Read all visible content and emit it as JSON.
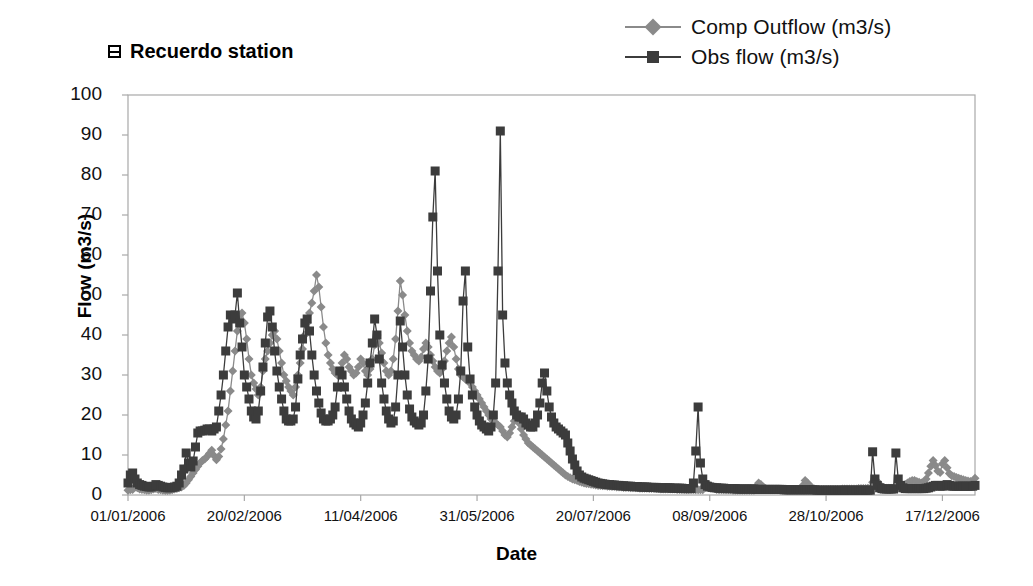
{
  "chart_title": "Recuerdo station",
  "title_icon": "table-grid-icon",
  "axes": {
    "xlabel": "Date",
    "ylabel": "Flow (m3/s)",
    "yticks": [
      "100",
      "90",
      "80",
      "70",
      "60",
      "50",
      "40",
      "30",
      "20",
      "10",
      "0"
    ],
    "ylim": [
      0,
      100
    ],
    "xticks": [
      "01/01/2006",
      "20/02/2006",
      "11/04/2006",
      "31/05/2006",
      "20/07/2006",
      "08/09/2006",
      "28/10/2006",
      "17/12/2006"
    ],
    "xlim_days": [
      0,
      364
    ],
    "xtick_days": [
      0,
      50,
      100,
      150,
      200,
      250,
      300,
      350
    ],
    "grid": false
  },
  "legend": {
    "position": "top-right",
    "entries": [
      {
        "label": "Comp Outflow (m3/s)",
        "marker": "diamond",
        "color": "#8a8a8a"
      },
      {
        "label": "Obs flow (m3/s)",
        "marker": "square",
        "color": "#3c3c3c"
      }
    ]
  },
  "colors": {
    "comp_outflow": "#8a8a8a",
    "obs_flow": "#3c3c3c",
    "axis": "#a8a8a8",
    "text": "#111111",
    "background": "#ffffff"
  },
  "chart_data": {
    "type": "line",
    "title": "Recuerdo station",
    "xlabel": "Date",
    "ylabel": "Flow (m3/s)",
    "ylim": [
      0,
      100
    ],
    "grid": false,
    "legend_position": "top-right",
    "x_start_date": "01/01/2006",
    "x_end_date": "31/12/2006",
    "x_unit": "day-of-year (0-364)",
    "series": [
      {
        "name": "Comp Outflow (m3/s)",
        "marker": "diamond",
        "color": "#8a8a8a",
        "values": [
          1.2,
          1.3,
          1.4,
          2.0,
          1.8,
          1.5,
          1.4,
          1.3,
          1.2,
          1.2,
          1.3,
          1.5,
          1.6,
          1.4,
          1.3,
          1.2,
          1.1,
          1.1,
          1.2,
          1.3,
          1.5,
          1.6,
          1.8,
          2.0,
          2.4,
          3.0,
          3.8,
          4.6,
          5.5,
          6.4,
          7.2,
          8.0,
          8.6,
          9.0,
          9.6,
          10.4,
          11.2,
          9.8,
          8.8,
          9.6,
          11.5,
          14.0,
          17.5,
          21.0,
          26.0,
          31.0,
          36.0,
          41.0,
          44.0,
          45.5,
          43.0,
          39.0,
          34.0,
          30.0,
          28.0,
          26.5,
          25.0,
          27.0,
          31.0,
          34.0,
          36.0,
          38.0,
          40.0,
          41.0,
          39.0,
          36.0,
          33.0,
          30.0,
          28.5,
          27.0,
          26.0,
          25.0,
          27.0,
          30.0,
          33.0,
          36.5,
          40.0,
          43.0,
          45.5,
          48.0,
          51.0,
          55.0,
          52.0,
          47.0,
          42.0,
          38.0,
          35.0,
          33.0,
          31.5,
          30.5,
          30.0,
          31.0,
          33.0,
          35.0,
          34.0,
          32.0,
          31.0,
          30.0,
          30.5,
          32.0,
          34.0,
          33.0,
          31.0,
          30.0,
          31.5,
          34.0,
          37.5,
          40.0,
          38.0,
          35.5,
          33.0,
          31.0,
          30.0,
          31.0,
          34.0,
          39.0,
          46.0,
          53.5,
          50.0,
          45.0,
          41.0,
          38.0,
          36.0,
          35.0,
          34.0,
          33.5,
          34.5,
          36.5,
          38.0,
          37.0,
          35.0,
          33.5,
          32.0,
          31.0,
          30.5,
          31.5,
          33.5,
          36.0,
          38.0,
          39.5,
          37.0,
          34.0,
          31.5,
          30.0,
          29.5,
          29.0,
          28.5,
          28.0,
          27.0,
          26.0,
          25.0,
          24.0,
          23.0,
          22.0,
          21.0,
          20.0,
          19.0,
          18.5,
          18.0,
          17.5,
          17.0,
          16.0,
          15.0,
          14.5,
          15.5,
          17.0,
          18.5,
          19.5,
          18.0,
          16.5,
          15.0,
          14.0,
          13.0,
          12.5,
          12.0,
          11.5,
          11.0,
          10.5,
          10.0,
          9.5,
          9.0,
          8.5,
          8.0,
          7.5,
          7.0,
          6.5,
          6.0,
          5.5,
          5.0,
          4.6,
          4.3,
          4.0,
          3.8,
          3.6,
          3.4,
          3.2,
          3.0,
          2.9,
          2.8,
          2.7,
          2.6,
          2.5,
          2.4,
          2.4,
          2.3,
          2.3,
          2.2,
          2.2,
          2.1,
          2.1,
          2.0,
          2.0,
          2.0,
          1.9,
          1.9,
          1.9,
          1.8,
          1.8,
          1.8,
          1.8,
          1.7,
          1.7,
          1.7,
          1.7,
          1.6,
          1.6,
          1.6,
          1.6,
          1.6,
          1.5,
          1.5,
          1.5,
          1.5,
          1.5,
          1.5,
          1.5,
          1.4,
          1.4,
          1.4,
          1.4,
          1.4,
          1.4,
          1.4,
          1.4,
          1.3,
          1.3,
          1.3,
          1.3,
          2.0,
          2.6,
          2.4,
          2.0,
          1.6,
          1.4,
          1.3,
          1.3,
          1.3,
          1.3,
          1.3,
          1.3,
          1.2,
          1.2,
          1.2,
          1.2,
          1.2,
          1.2,
          1.2,
          1.2,
          1.2,
          1.2,
          2.2,
          3.0,
          2.6,
          2.0,
          1.6,
          1.4,
          1.3,
          1.3,
          1.3,
          1.3,
          1.3,
          1.3,
          1.3,
          1.3,
          1.3,
          1.3,
          1.3,
          1.3,
          1.3,
          1.3,
          2.4,
          3.6,
          3.0,
          2.4,
          1.8,
          1.5,
          1.4,
          1.4,
          1.4,
          1.4,
          1.4,
          1.4,
          1.4,
          1.4,
          1.4,
          1.4,
          1.4,
          1.5,
          1.5,
          1.5,
          1.5,
          1.5,
          1.5,
          1.5,
          1.6,
          1.6,
          1.6,
          1.6,
          1.7,
          1.7,
          3.2,
          4.0,
          3.4,
          2.6,
          2.0,
          1.8,
          1.7,
          1.7,
          1.7,
          1.8,
          1.8,
          1.9,
          2.0,
          2.2,
          2.6,
          3.0,
          3.4,
          3.6,
          3.6,
          3.4,
          3.2,
          3.0,
          3.2,
          4.0,
          5.5,
          7.2,
          8.6,
          7.4,
          6.0,
          5.6,
          7.8,
          8.6,
          6.8,
          5.4,
          4.8,
          4.6,
          4.4,
          4.2,
          4.0,
          3.8,
          3.6,
          3.5,
          3.4,
          3.4,
          4.2
        ]
      },
      {
        "name": "Obs flow (m3/s)",
        "marker": "square",
        "color": "#3c3c3c",
        "values": [
          3.0,
          5.0,
          5.5,
          4.0,
          3.0,
          2.6,
          2.4,
          2.2,
          2.1,
          2.0,
          2.0,
          2.2,
          2.6,
          2.4,
          2.2,
          2.0,
          1.9,
          1.8,
          1.8,
          1.9,
          2.0,
          2.2,
          3.0,
          5.0,
          6.5,
          10.5,
          8.0,
          7.0,
          8.5,
          12.0,
          15.5,
          16.0,
          16.0,
          16.2,
          16.5,
          16.5,
          16.0,
          16.5,
          17.0,
          21.0,
          25.0,
          30.0,
          36.0,
          42.0,
          45.0,
          44.0,
          45.0,
          50.5,
          43.0,
          37.0,
          30.0,
          27.0,
          24.0,
          21.0,
          19.5,
          19.0,
          21.0,
          26.0,
          32.0,
          38.0,
          44.5,
          46.0,
          42.0,
          36.0,
          31.0,
          27.0,
          24.0,
          21.0,
          19.0,
          18.5,
          18.5,
          19.0,
          22.0,
          29.0,
          35.0,
          39.0,
          43.0,
          44.0,
          41.0,
          35.0,
          30.0,
          26.0,
          23.0,
          20.5,
          19.0,
          18.5,
          18.5,
          19.0,
          20.0,
          22.0,
          27.0,
          31.0,
          30.0,
          27.0,
          24.0,
          21.0,
          19.0,
          18.0,
          17.5,
          17.0,
          18.0,
          20.0,
          23.0,
          28.0,
          33.0,
          38.0,
          44.0,
          40.0,
          34.0,
          28.0,
          24.0,
          21.0,
          19.0,
          18.0,
          18.5,
          22.0,
          30.0,
          43.5,
          37.0,
          30.0,
          25.0,
          21.5,
          19.5,
          18.5,
          18.0,
          17.5,
          18.0,
          20.0,
          26.0,
          34.0,
          51.0,
          69.5,
          81.0,
          56.0,
          40.0,
          32.5,
          28.0,
          24.0,
          21.0,
          19.5,
          19.0,
          20.0,
          24.0,
          31.0,
          48.5,
          56.0,
          37.0,
          29.0,
          25.0,
          22.0,
          20.0,
          18.5,
          17.5,
          17.0,
          16.5,
          16.0,
          17.0,
          20.0,
          28.0,
          56.0,
          91.0,
          45.0,
          33.0,
          28.0,
          25.0,
          23.0,
          21.0,
          20.0,
          19.5,
          19.5,
          19.0,
          18.0,
          17.5,
          17.0,
          17.0,
          18.0,
          20.0,
          23.0,
          28.0,
          30.5,
          26.0,
          22.0,
          19.5,
          18.0,
          17.0,
          16.5,
          16.0,
          15.5,
          15.0,
          13.0,
          11.0,
          9.0,
          7.5,
          6.0,
          5.0,
          4.5,
          4.2,
          4.0,
          3.8,
          3.6,
          3.4,
          3.2,
          3.0,
          2.9,
          2.8,
          2.7,
          2.6,
          2.6,
          2.5,
          2.5,
          2.4,
          2.4,
          2.3,
          2.3,
          2.2,
          2.2,
          2.2,
          2.1,
          2.1,
          2.1,
          2.0,
          2.0,
          2.0,
          2.0,
          1.9,
          1.9,
          1.9,
          1.9,
          1.8,
          1.8,
          1.8,
          1.8,
          1.8,
          1.8,
          1.7,
          1.7,
          1.7,
          1.7,
          1.7,
          1.6,
          1.6,
          1.6,
          1.6,
          3.0,
          11.0,
          22.0,
          8.0,
          4.0,
          2.6,
          2.2,
          2.0,
          1.9,
          1.8,
          1.8,
          1.7,
          1.7,
          1.7,
          1.6,
          1.6,
          1.6,
          1.6,
          1.6,
          1.5,
          1.5,
          1.5,
          1.5,
          1.5,
          1.5,
          1.5,
          1.5,
          1.4,
          1.4,
          1.4,
          1.4,
          1.4,
          1.4,
          1.4,
          1.4,
          1.4,
          1.4,
          1.4,
          1.4,
          1.3,
          1.3,
          1.3,
          1.3,
          1.3,
          1.3,
          1.3,
          1.3,
          1.3,
          1.3,
          1.3,
          1.3,
          1.3,
          1.3,
          1.2,
          1.2,
          1.2,
          1.2,
          1.2,
          1.2,
          1.2,
          1.2,
          1.2,
          1.2,
          1.2,
          1.2,
          1.2,
          1.2,
          1.2,
          1.2,
          1.2,
          1.2,
          1.2,
          1.2,
          1.2,
          1.2,
          1.2,
          1.2,
          10.8,
          4.0,
          2.4,
          1.8,
          1.6,
          1.5,
          1.5,
          1.5,
          1.5,
          1.5,
          10.5,
          4.0,
          2.4,
          1.8,
          1.6,
          1.6,
          1.6,
          1.6,
          1.6,
          1.6,
          1.6,
          1.6,
          1.6,
          1.7,
          1.8,
          2.0,
          2.2,
          2.4,
          2.4,
          2.2,
          2.2,
          2.4,
          2.6,
          2.4,
          2.2,
          2.2,
          2.2,
          2.2,
          2.2,
          2.2,
          2.2,
          2.2,
          2.2,
          2.2,
          2.4
        ]
      }
    ]
  }
}
